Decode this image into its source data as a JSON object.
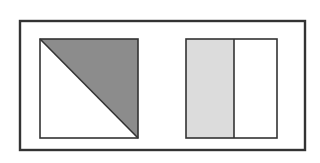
{
  "figure": {
    "canvas": {
      "width": 320,
      "height": 163,
      "background": "#ffffff"
    },
    "outer_frame": {
      "name": "outer-rectangle-border",
      "x": 20,
      "y": 21,
      "width": 285,
      "height": 129,
      "stroke": "#333333",
      "stroke_width": 2.4,
      "fill": "none"
    },
    "shapes": [
      {
        "id": "diagonal-square",
        "label": "Square divided by a diagonal, upper-right half shaded",
        "x": 40,
        "y": 39,
        "width": 98,
        "height": 99,
        "stroke": "#333333",
        "stroke_width": 1.6,
        "fill": "#ffffff",
        "divider": {
          "type": "diagonal",
          "from": "top-left",
          "to": "bottom-right",
          "stroke": "#333333",
          "stroke_width": 1.6
        },
        "shaded_region": {
          "name": "upper-right-triangle",
          "fill": "#8c8c8c",
          "fraction_label": "1/2"
        },
        "unshaded_region": {
          "name": "lower-left-triangle",
          "fill": "#ffffff"
        }
      },
      {
        "id": "split-rectangle",
        "label": "Rectangle divided by a vertical line, left part shaded",
        "x": 186,
        "y": 39,
        "width": 91,
        "height": 99,
        "stroke": "#333333",
        "stroke_width": 1.6,
        "fill": "#ffffff",
        "divider": {
          "type": "vertical",
          "x": 234,
          "stroke": "#333333",
          "stroke_width": 1.6
        },
        "shaded_region": {
          "name": "left-panel",
          "fill": "#dcdcdc",
          "x": 186,
          "y": 39,
          "width": 48,
          "height": 99
        },
        "unshaded_region": {
          "name": "right-panel",
          "fill": "#ffffff",
          "x": 234,
          "y": 39,
          "width": 43,
          "height": 99
        }
      }
    ],
    "colors": {
      "outline": "#333333",
      "shade_dark": "#8c8c8c",
      "shade_light": "#dcdcdc",
      "background": "#ffffff"
    }
  }
}
